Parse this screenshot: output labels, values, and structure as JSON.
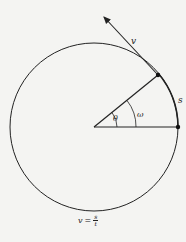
{
  "diagram": {
    "type": "uniform-circular-motion",
    "labels": {
      "velocity": "v",
      "arc_length": "s",
      "angle": "θ",
      "angular_velocity": "ω"
    },
    "formula": {
      "lhs": "v",
      "equals": "=",
      "numerator": "s",
      "denominator": "t"
    },
    "colors": {
      "stroke": "#222222",
      "background": "#f4f4f2"
    }
  }
}
